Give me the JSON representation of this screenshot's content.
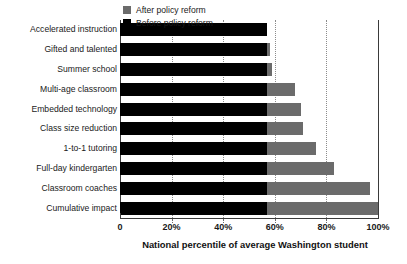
{
  "chart_data": {
    "type": "bar",
    "orientation": "horizontal",
    "title": "",
    "xlabel": "National percentile of average Washington student",
    "ylabel": "",
    "xlim": [
      0,
      100
    ],
    "xticks": [
      0,
      20,
      40,
      60,
      80,
      100
    ],
    "xtick_labels": [
      "0",
      "20%",
      "40%",
      "60%",
      "80%",
      "100%"
    ],
    "grid": true,
    "grid_axis": "x",
    "legend_position": "top-left",
    "categories": [
      "Accelerated instruction",
      "Gifted and talented",
      "Summer school",
      "Multi-age classroom",
      "Embedded technology",
      "Class size reduction",
      "1-to-1 tutoring",
      "Full-day kindergarten",
      "Classroom coaches",
      "Cumulative impact"
    ],
    "series": [
      {
        "name": "Before policy reform",
        "color": "#000000",
        "values": [
          57,
          57,
          57,
          57,
          57,
          57,
          57,
          57,
          57,
          57
        ]
      },
      {
        "name": "After policy reform",
        "color": "#6b6b6b",
        "values": [
          57,
          58,
          59,
          68,
          70,
          71,
          76,
          83,
          97,
          100
        ]
      }
    ]
  },
  "legend": {
    "entries": [
      {
        "label": "After policy reform",
        "color": "#6b6b6b"
      },
      {
        "label": "Before policy reform",
        "color": "#000000"
      }
    ]
  },
  "axis": {
    "x_title": "National percentile of average Washington student",
    "tick_labels": [
      "0",
      "20%",
      "40%",
      "60%",
      "80%",
      "100%"
    ]
  }
}
